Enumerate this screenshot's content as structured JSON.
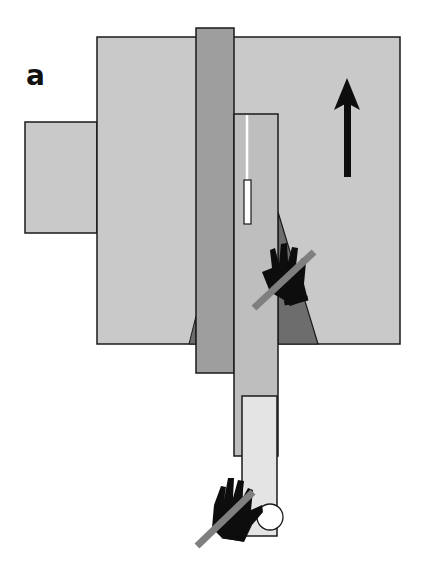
{
  "figure": {
    "panel_label": "a",
    "colors": {
      "table": "#c9c9c9",
      "blade": "#9e9e9e",
      "workpiece": "#bebebe",
      "push_block": "#e4e4e4",
      "kickback_zone": "#6d6d6d",
      "outline": "#1a1a1a",
      "prohibit_slash": "#7f7f7f",
      "glove": "#0d0d0d",
      "arrow": "#0d0d0d"
    },
    "elements": {
      "side_extension": {
        "x": 25,
        "y": 122,
        "w": 72,
        "h": 111
      },
      "table": {
        "x": 97,
        "y": 37,
        "w": 303,
        "h": 307
      },
      "blade": {
        "x": 196,
        "y": 28,
        "w": 38,
        "h": 345
      },
      "workpiece": {
        "x": 234,
        "y": 114,
        "w": 44,
        "h": 342
      },
      "kerf_slot": {
        "x": 244,
        "y": 180,
        "w": 7,
        "h": 44
      },
      "push_block": {
        "x": 242,
        "y": 396,
        "w": 35,
        "h": 140
      },
      "feed_arrow": {
        "direction": "up",
        "x": 347,
        "y_tip": 78,
        "y_tail": 177
      }
    }
  }
}
